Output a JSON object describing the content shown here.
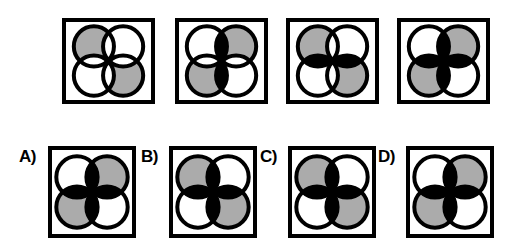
{
  "page": {
    "width": 508,
    "height": 252,
    "background_color": "#ffffff"
  },
  "colors": {
    "outline": "#000000",
    "fill_gray": "#ababab",
    "fill_white": "#ffffff",
    "fill_black": "#000000",
    "box_border": "#000000",
    "label_text": "#000000"
  },
  "geometry": {
    "circle_outline_width": 4,
    "lens_outline_width": 2.5,
    "box_border_width": 4
  },
  "sequence_row": {
    "name": "pattern-sequence",
    "y": 18,
    "figures": [
      {
        "index": 1,
        "name": "sequence-figure-1",
        "box": {
          "x": 62,
          "y": 18,
          "width": 93,
          "height": 86
        },
        "circles": {
          "top_left": "gray",
          "top_right": "white",
          "bottom_left": "white",
          "bottom_right": "gray"
        },
        "lenses": {
          "top": "white",
          "bottom": "white",
          "left": "white",
          "right": "white"
        }
      },
      {
        "index": 2,
        "name": "sequence-figure-2",
        "box": {
          "x": 175,
          "y": 18,
          "width": 93,
          "height": 86
        },
        "circles": {
          "top_left": "white",
          "top_right": "gray",
          "bottom_left": "gray",
          "bottom_right": "white"
        },
        "lenses": {
          "top": "black",
          "bottom": "black",
          "left": "white",
          "right": "white"
        }
      },
      {
        "index": 3,
        "name": "sequence-figure-3",
        "box": {
          "x": 286,
          "y": 18,
          "width": 93,
          "height": 86
        },
        "circles": {
          "top_left": "gray",
          "top_right": "white",
          "bottom_left": "white",
          "bottom_right": "gray"
        },
        "lenses": {
          "top": "white",
          "bottom": "white",
          "left": "black",
          "right": "black"
        }
      },
      {
        "index": 4,
        "name": "sequence-figure-4",
        "box": {
          "x": 397,
          "y": 18,
          "width": 93,
          "height": 86
        },
        "circles": {
          "top_left": "white",
          "top_right": "gray",
          "bottom_left": "gray",
          "bottom_right": "white"
        },
        "lenses": {
          "top": "black",
          "bottom": "black",
          "left": "black",
          "right": "black"
        }
      }
    ]
  },
  "options_row": {
    "name": "answer-options",
    "y": 148,
    "options": [
      {
        "key": "A",
        "label": "A)",
        "name": "option-a",
        "label_pos": {
          "x": 19,
          "y": 148,
          "font_size": 17
        },
        "box": {
          "x": 48,
          "y": 146,
          "width": 88,
          "height": 92
        },
        "circles": {
          "top_left": "white",
          "top_right": "gray",
          "bottom_left": "gray",
          "bottom_right": "white"
        },
        "lenses": {
          "top": "black",
          "bottom": "black",
          "left": "black",
          "right": "black"
        }
      },
      {
        "key": "B",
        "label": "B)",
        "name": "option-b",
        "label_pos": {
          "x": 141,
          "y": 148,
          "font_size": 17
        },
        "box": {
          "x": 169,
          "y": 146,
          "width": 88,
          "height": 92
        },
        "circles": {
          "top_left": "gray",
          "top_right": "white",
          "bottom_left": "white",
          "bottom_right": "gray"
        },
        "lenses": {
          "top": "black",
          "bottom": "black",
          "left": "black",
          "right": "black"
        }
      },
      {
        "key": "C",
        "label": "C)",
        "name": "option-c",
        "label_pos": {
          "x": 260,
          "y": 148,
          "font_size": 17
        },
        "box": {
          "x": 288,
          "y": 146,
          "width": 88,
          "height": 92
        },
        "circles": {
          "top_left": "gray",
          "top_right": "white",
          "bottom_left": "white",
          "bottom_right": "gray"
        },
        "lenses": {
          "top": "black",
          "bottom": "black",
          "left": "black",
          "right": "black"
        }
      },
      {
        "key": "D",
        "label": "D)",
        "name": "option-d",
        "label_pos": {
          "x": 378,
          "y": 148,
          "font_size": 17
        },
        "box": {
          "x": 406,
          "y": 146,
          "width": 88,
          "height": 92
        },
        "circles": {
          "top_left": "white",
          "top_right": "gray",
          "bottom_left": "gray",
          "bottom_right": "white"
        },
        "lenses": {
          "top": "black",
          "bottom": "black",
          "left": "black",
          "right": "black"
        }
      }
    ]
  }
}
